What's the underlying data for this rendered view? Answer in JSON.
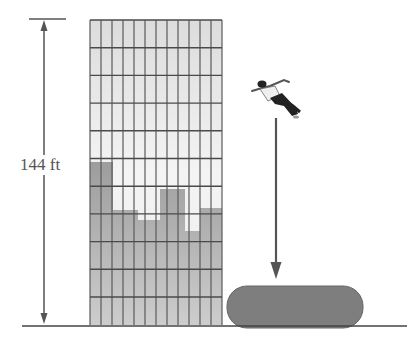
{
  "diagram": {
    "height_label": "144 ft",
    "colors": {
      "building_light": "#e6e6e6",
      "building_shadow": "#a9a9a9",
      "grid_line": "#5a5a5a",
      "arrow": "#555555",
      "air_cushion": "#7e7e7e",
      "ground": "#444444",
      "label_text": "#555555"
    },
    "building": {
      "columns": 12,
      "rows": 11
    },
    "elements": [
      "building",
      "height-dimension-arrow",
      "falling-person",
      "fall-direction-arrow",
      "air-cushion",
      "ground-line"
    ]
  }
}
